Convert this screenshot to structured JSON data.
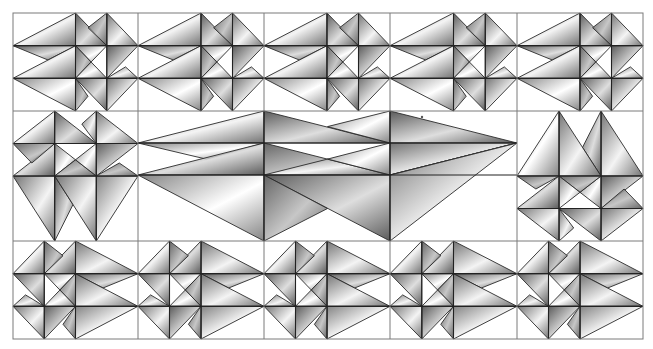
{
  "image": {
    "width": 653,
    "height": 349,
    "background": "#ffffff",
    "grid_color": "#7a7a7a",
    "stroke_color": "#2a2a2a"
  },
  "grid": {
    "columns_x": [
      13,
      138,
      264,
      390,
      517,
      643
    ],
    "rows_y": [
      13,
      111,
      241,
      339
    ]
  },
  "palette": {
    "g1": {
      "light": "#f2f2f2",
      "dark": "#5a5a5a"
    },
    "g2": {
      "light": "#d8d8d8",
      "dark": "#3e3e3e"
    },
    "g3": {
      "light": "#ffffff",
      "dark": "#6e6e6e"
    },
    "g4": {
      "light": "#bdbdbd",
      "dark": "#4a4a4a"
    }
  },
  "base_tile": {
    "description": "wide tile in unit coords; x stops 0,.5,.75,1; y stops 0,1/3,2/3,1",
    "polygons": [
      {
        "pts": [
          [
            0,
            0.3333
          ],
          [
            0.5,
            0
          ],
          [
            0.5,
            0.3333
          ]
        ],
        "shade": "g1"
      },
      {
        "pts": [
          [
            0,
            0.3333
          ],
          [
            0.5,
            0.3333
          ],
          [
            0.28,
            0.48
          ]
        ],
        "shade": "g2"
      },
      {
        "pts": [
          [
            0,
            0.6667
          ],
          [
            0.5,
            0.3333
          ],
          [
            0.5,
            0.6667
          ]
        ],
        "shade": "g1"
      },
      {
        "pts": [
          [
            0,
            0.6667
          ],
          [
            0.5,
            0.6667
          ],
          [
            0.5,
            1
          ]
        ],
        "shade": "g3"
      },
      {
        "pts": [
          [
            0.5,
            0
          ],
          [
            0.75,
            0.3333
          ],
          [
            0.5,
            0.3333
          ]
        ],
        "shade": "g2"
      },
      {
        "pts": [
          [
            0.75,
            0
          ],
          [
            1,
            0.3333
          ],
          [
            0.75,
            0.3333
          ]
        ],
        "shade": "g1"
      },
      {
        "pts": [
          [
            0.6,
            0.15
          ],
          [
            0.75,
            0
          ],
          [
            0.75,
            0.3333
          ]
        ],
        "shade": "g4"
      },
      {
        "pts": [
          [
            0.5,
            0.3333
          ],
          [
            0.75,
            0.3333
          ],
          [
            0.625,
            0.5
          ]
        ],
        "shade": "g3"
      },
      {
        "pts": [
          [
            0.75,
            0.3333
          ],
          [
            1,
            0.3333
          ],
          [
            0.75,
            0.6667
          ]
        ],
        "shade": "g2"
      },
      {
        "pts": [
          [
            0.5,
            0.3333
          ],
          [
            0.625,
            0.5
          ],
          [
            0.5,
            0.6667
          ]
        ],
        "shade": "g4"
      },
      {
        "pts": [
          [
            0.625,
            0.5
          ],
          [
            0.75,
            0.6667
          ],
          [
            0.5,
            0.6667
          ]
        ],
        "shade": "g3"
      },
      {
        "pts": [
          [
            0.75,
            0.6667
          ],
          [
            0.9,
            0.55
          ],
          [
            1,
            0.6667
          ]
        ],
        "shade": "g1"
      },
      {
        "pts": [
          [
            0.5,
            0.6667
          ],
          [
            0.75,
            0.6667
          ],
          [
            0.75,
            1
          ]
        ],
        "shade": "g2"
      },
      {
        "pts": [
          [
            0.75,
            0.6667
          ],
          [
            1,
            0.6667
          ],
          [
            0.75,
            1
          ]
        ],
        "shade": "g1"
      },
      {
        "pts": [
          [
            0.5,
            0.6667
          ],
          [
            0.6,
            0.85
          ],
          [
            0.5,
            1
          ]
        ],
        "shade": "g4"
      }
    ],
    "lines": [
      [
        [
          0,
          0.3333
        ],
        [
          1,
          0.3333
        ]
      ],
      [
        [
          0,
          0.6667
        ],
        [
          1,
          0.6667
        ]
      ],
      [
        [
          0.5,
          0
        ],
        [
          0.5,
          1
        ]
      ],
      [
        [
          0.75,
          0
        ],
        [
          0.75,
          1
        ]
      ]
    ]
  },
  "center_panel": {
    "x": 138,
    "y": 111,
    "w": 379,
    "h": 130,
    "polygons": [
      {
        "pts": [
          [
            0,
            0.246
          ],
          [
            0.3325,
            0
          ],
          [
            0.3325,
            0.246
          ]
        ],
        "shade": "g1"
      },
      {
        "pts": [
          [
            0,
            0.246
          ],
          [
            0.3325,
            0.246
          ],
          [
            0.18,
            0.37
          ]
        ],
        "shade": "g3"
      },
      {
        "pts": [
          [
            0,
            0.492
          ],
          [
            0.3325,
            0.246
          ],
          [
            0.3325,
            0.492
          ]
        ],
        "shade": "g2"
      },
      {
        "pts": [
          [
            0,
            0.492
          ],
          [
            0.3325,
            0.492
          ],
          [
            0.3325,
            1
          ]
        ],
        "shade": "g3"
      },
      {
        "pts": [
          [
            0.3325,
            0
          ],
          [
            0.665,
            0.246
          ],
          [
            0.3325,
            0.246
          ]
        ],
        "shade": "g2"
      },
      {
        "pts": [
          [
            0.5,
            0.12
          ],
          [
            0.665,
            0
          ],
          [
            0.665,
            0.246
          ]
        ],
        "shade": "g3"
      },
      {
        "pts": [
          [
            0.3325,
            0.246
          ],
          [
            0.665,
            0.492
          ],
          [
            0.3325,
            0.492
          ]
        ],
        "shade": "g4"
      },
      {
        "pts": [
          [
            0.3325,
            0.492
          ],
          [
            0.5,
            0.37
          ],
          [
            0.665,
            0.492
          ]
        ],
        "shade": "g3"
      },
      {
        "pts": [
          [
            0.5,
            0.37
          ],
          [
            0.665,
            0.246
          ],
          [
            0.665,
            0.492
          ]
        ],
        "shade": "g3"
      },
      {
        "pts": [
          [
            0.3325,
            0.492
          ],
          [
            0.665,
            0.492
          ],
          [
            0.665,
            1
          ]
        ],
        "shade": "g2"
      },
      {
        "pts": [
          [
            0.3325,
            0.492
          ],
          [
            0.5,
            0.75
          ],
          [
            0.3325,
            1
          ]
        ],
        "shade": "g4"
      },
      {
        "pts": [
          [
            0.665,
            0
          ],
          [
            1,
            0.246
          ],
          [
            0.665,
            0.246
          ]
        ],
        "shade": "g2"
      },
      {
        "pts": [
          [
            0.665,
            0.246
          ],
          [
            1,
            0.246
          ],
          [
            0.665,
            0.492
          ]
        ],
        "shade": "g1"
      },
      {
        "pts": [
          [
            0.665,
            0.492
          ],
          [
            0.82,
            0.38
          ],
          [
            1,
            0.246
          ]
        ],
        "shade": "g2"
      },
      {
        "pts": [
          [
            0.665,
            0.492
          ],
          [
            1,
            0.246
          ],
          [
            0.665,
            1
          ]
        ],
        "shade": "g1"
      }
    ],
    "lines": [
      [
        [
          0,
          0.246
        ],
        [
          1,
          0.246
        ]
      ],
      [
        [
          0,
          0.492
        ],
        [
          1,
          0.492
        ]
      ],
      [
        [
          0.3325,
          0
        ],
        [
          0.3325,
          1
        ]
      ],
      [
        [
          0.665,
          0
        ],
        [
          0.665,
          1
        ]
      ]
    ]
  },
  "cells": [
    {
      "name": "tile-r1-c1",
      "x": 13,
      "y": 13,
      "w": 125,
      "h": 98,
      "transform": "none"
    },
    {
      "name": "tile-r1-c2",
      "x": 138,
      "y": 13,
      "w": 126,
      "h": 98,
      "transform": "none"
    },
    {
      "name": "tile-r1-c3",
      "x": 264,
      "y": 13,
      "w": 126,
      "h": 98,
      "transform": "none"
    },
    {
      "name": "tile-r1-c4",
      "x": 390,
      "y": 13,
      "w": 127,
      "h": 98,
      "transform": "none"
    },
    {
      "name": "tile-r1-c5",
      "x": 517,
      "y": 13,
      "w": 126,
      "h": 98,
      "transform": "none"
    },
    {
      "name": "tile-r2-c1",
      "x": 13,
      "y": 111,
      "w": 125,
      "h": 130,
      "transform": "rot-left"
    },
    {
      "name": "tile-r2-c5",
      "x": 517,
      "y": 111,
      "w": 126,
      "h": 130,
      "transform": "rot-right"
    },
    {
      "name": "tile-r3-c1",
      "x": 13,
      "y": 241,
      "w": 125,
      "h": 98,
      "transform": "mirror-x"
    },
    {
      "name": "tile-r3-c2",
      "x": 138,
      "y": 241,
      "w": 126,
      "h": 98,
      "transform": "mirror-x"
    },
    {
      "name": "tile-r3-c3",
      "x": 264,
      "y": 241,
      "w": 126,
      "h": 98,
      "transform": "mirror-x"
    },
    {
      "name": "tile-r3-c4",
      "x": 390,
      "y": 241,
      "w": 127,
      "h": 98,
      "transform": "mirror-x"
    },
    {
      "name": "tile-r3-c5",
      "x": 517,
      "y": 241,
      "w": 126,
      "h": 98,
      "transform": "mirror-x"
    }
  ],
  "artifacts": [
    {
      "name": "speck",
      "x": 422,
      "y": 117,
      "r": 1.2,
      "color": "#555555"
    }
  ]
}
